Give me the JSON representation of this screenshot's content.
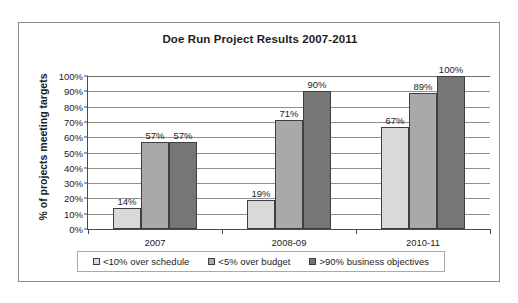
{
  "chart_data": {
    "type": "bar",
    "title": "Doe Run Project Results 2007-2011",
    "xlabel": "",
    "ylabel": "% of projects meeting targets",
    "categories": [
      "2007",
      "2008-09",
      "2010-11"
    ],
    "series": [
      {
        "name": "<10% over schedule",
        "color": "#d9d9d9",
        "values": [
          14,
          19,
          67
        ],
        "labels": [
          "14%",
          "19%",
          "67%"
        ]
      },
      {
        "name": "<5% over budget",
        "color": "#a9a9a9",
        "values": [
          57,
          71,
          89
        ],
        "labels": [
          "57%",
          "71%",
          "89%"
        ]
      },
      {
        "name": ">90% business objectives",
        "color": "#767676",
        "values": [
          57,
          90,
          100
        ],
        "labels": [
          "57%",
          "90%",
          "100%"
        ]
      }
    ],
    "ylim": [
      0,
      100
    ],
    "ytick_values": [
      0,
      10,
      20,
      30,
      40,
      50,
      60,
      70,
      80,
      90,
      100
    ],
    "ytick_labels": [
      "0%",
      "10%",
      "20%",
      "30%",
      "40%",
      "50%",
      "60%",
      "70%",
      "80%",
      "90%",
      "100%"
    ],
    "grid": true,
    "grid_axis": "y",
    "legend_position": "bottom",
    "legend_entries": [
      "<10% over schedule",
      "<5% over budget",
      ">90% business objectives"
    ]
  }
}
